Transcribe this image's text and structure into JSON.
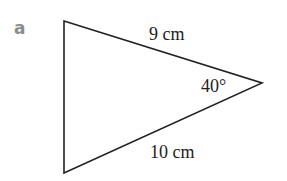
{
  "part_label": "a",
  "triangle": {
    "vertices": [
      {
        "name": "top-left",
        "x": 64,
        "y": 21
      },
      {
        "name": "right",
        "x": 262,
        "y": 83
      },
      {
        "name": "bottom-left",
        "x": 64,
        "y": 173
      }
    ],
    "stroke_color": "#222222",
    "side_top_label": "9 cm",
    "side_bottom_label": "10 cm",
    "angle_label": "40°"
  }
}
